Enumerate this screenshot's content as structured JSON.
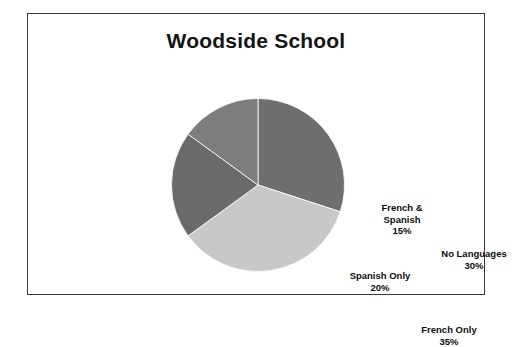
{
  "figure": {
    "title": "Woodside School",
    "frame_color": "#3a3a3a",
    "background": "#ffffff"
  },
  "chart_data": {
    "type": "pie",
    "title": "Woodside School",
    "xlabel": "",
    "ylabel": "",
    "legend": "none",
    "grid": false,
    "start_angle_deg": 0,
    "direction": "clockwise",
    "categories": [
      "No Languages",
      "French Only",
      "Spanish Only",
      "French & Spanish"
    ],
    "values": [
      30,
      35,
      20,
      15
    ],
    "value_unit": "%",
    "total": 100,
    "colors": [
      "#6e6e6e",
      "#c8c8c8",
      "#6a6a6a",
      "#7d7d7d"
    ],
    "slices": [
      {
        "label": "No Languages",
        "value": 30,
        "percent_label": "30%",
        "color": "#6e6e6e",
        "label_lines": [
          "No Languages"
        ]
      },
      {
        "label": "French Only",
        "value": 35,
        "percent_label": "35%",
        "color": "#c8c8c8",
        "label_lines": [
          "French Only"
        ]
      },
      {
        "label": "Spanish Only",
        "value": 20,
        "percent_label": "20%",
        "color": "#6a6a6a",
        "label_lines": [
          "Spanish Only"
        ]
      },
      {
        "label": "French & Spanish",
        "value": 15,
        "percent_label": "15%",
        "color": "#7d7d7d",
        "label_lines": [
          "French &",
          "Spanish"
        ]
      }
    ]
  }
}
